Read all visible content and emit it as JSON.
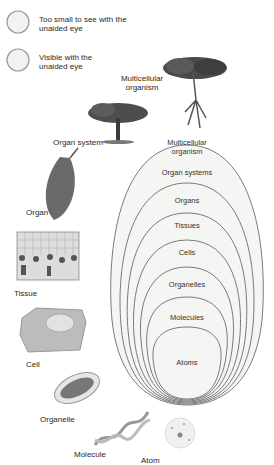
{
  "legend": [
    {
      "label_line1": "Too small to see with the",
      "label_line2": "unaided eye"
    },
    {
      "label_line1": "Visible with the",
      "label_line2": "unaided eye"
    }
  ],
  "side_labels": {
    "multicellular_organism_l1": "Multicellular",
    "multicellular_organism_l2": "organism",
    "organ_system": "Organ system",
    "organ": "Organ",
    "tissue": "Tissue",
    "cell": "Cell",
    "organelle": "Organelle",
    "molecule": "Molecule",
    "atom": "Atom"
  },
  "nested_levels": {
    "multicellular_l1": "Multicellular",
    "multicellular_l2": "organism",
    "organ_systems": "Organ systems",
    "organs": "Organs",
    "tissues": "Tissues",
    "cells": "Cells",
    "organelles": "Organelles",
    "molecules": "Molecules",
    "atoms": "Atoms"
  },
  "colors": {
    "ellipse_stroke": "#7a7a7a",
    "ellipse_fill": "#f4f4f2"
  }
}
